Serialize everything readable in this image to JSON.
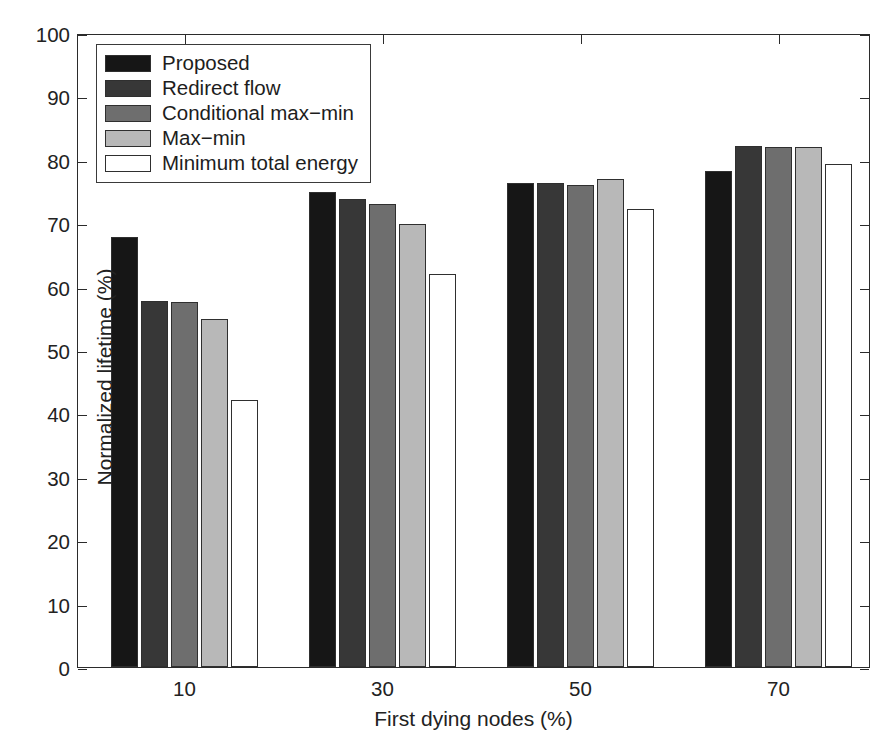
{
  "chart_data": {
    "type": "bar",
    "title": "",
    "xlabel": "First dying nodes (%)",
    "ylabel": "Normalized lifetime (%)",
    "categories": [
      "10",
      "30",
      "50",
      "70"
    ],
    "ylim": [
      0,
      100
    ],
    "yticks": [
      0,
      10,
      20,
      30,
      40,
      50,
      60,
      70,
      80,
      90,
      100
    ],
    "xticklabels": [
      "10",
      "30",
      "50",
      "70"
    ],
    "grid": false,
    "legend_position": "top-left",
    "series": [
      {
        "name": "Proposed",
        "color": "#161616",
        "values": [
          67.8,
          75.0,
          76.4,
          78.3
        ]
      },
      {
        "name": "Redirect flow",
        "color": "#373737",
        "values": [
          57.8,
          73.8,
          76.3,
          82.2
        ]
      },
      {
        "name": "Conditional max−min",
        "color": "#6e6e6e",
        "values": [
          57.5,
          73.1,
          76.0,
          82.0
        ]
      },
      {
        "name": "Max−min",
        "color": "#b8b8b8",
        "values": [
          54.9,
          69.8,
          76.9,
          82.0
        ]
      },
      {
        "name": "Minimum total energy",
        "color": "#ffffff",
        "values": [
          42.1,
          62.0,
          72.3,
          79.3
        ]
      }
    ]
  },
  "legend": {
    "items": [
      {
        "label": "Proposed"
      },
      {
        "label": "Redirect flow"
      },
      {
        "label": "Conditional max−min"
      },
      {
        "label": "Max−min"
      },
      {
        "label": "Minimum total energy"
      }
    ]
  }
}
